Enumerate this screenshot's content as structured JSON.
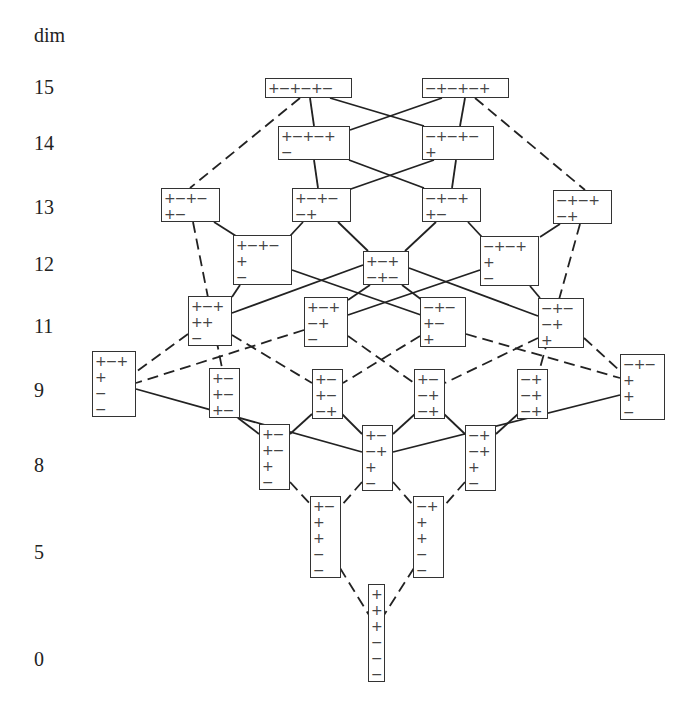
{
  "axis": {
    "title": "dim",
    "levels": [
      {
        "label": "15",
        "y": 88
      },
      {
        "label": "14",
        "y": 144
      },
      {
        "label": "13",
        "y": 208
      },
      {
        "label": "12",
        "y": 265
      },
      {
        "label": "11",
        "y": 327
      },
      {
        "label": "9",
        "y": 391
      },
      {
        "label": "8",
        "y": 466
      },
      {
        "label": "5",
        "y": 553
      },
      {
        "label": "0",
        "y": 660
      }
    ]
  },
  "nodes": [
    {
      "id": "n15a",
      "x": 265,
      "y": 78,
      "w": 87,
      "h": 20,
      "rows": [
        "+−+−+−"
      ]
    },
    {
      "id": "n15b",
      "x": 422,
      "y": 78,
      "w": 87,
      "h": 20,
      "rows": [
        "−+−+−+"
      ]
    },
    {
      "id": "n14a",
      "x": 278,
      "y": 126,
      "w": 72,
      "h": 34,
      "rows": [
        "+−+−+",
        "−"
      ]
    },
    {
      "id": "n14b",
      "x": 422,
      "y": 126,
      "w": 72,
      "h": 34,
      "rows": [
        "−+−+−",
        "+"
      ]
    },
    {
      "id": "n13a",
      "x": 161,
      "y": 188,
      "w": 59,
      "h": 34,
      "rows": [
        "+−+−",
        "+−"
      ]
    },
    {
      "id": "n13b",
      "x": 292,
      "y": 188,
      "w": 59,
      "h": 34,
      "rows": [
        "+−+−",
        "−+"
      ]
    },
    {
      "id": "n13c",
      "x": 422,
      "y": 188,
      "w": 59,
      "h": 34,
      "rows": [
        "−+−+",
        "+−"
      ]
    },
    {
      "id": "n13d",
      "x": 553,
      "y": 190,
      "w": 59,
      "h": 34,
      "rows": [
        "−+−+",
        "−+"
      ]
    },
    {
      "id": "n12a",
      "x": 233,
      "y": 235,
      "w": 59,
      "h": 50,
      "rows": [
        "+−+−",
        "+",
        "−"
      ]
    },
    {
      "id": "n12b",
      "x": 363,
      "y": 251,
      "w": 46,
      "h": 34,
      "rows": [
        "+−+",
        "−+−"
      ]
    },
    {
      "id": "n12c",
      "x": 480,
      "y": 236,
      "w": 59,
      "h": 50,
      "rows": [
        "−+−+",
        "+",
        "−"
      ]
    },
    {
      "id": "n11a",
      "x": 188,
      "y": 296,
      "w": 44,
      "h": 50,
      "rows": [
        "+−+",
        "++",
        "−"
      ]
    },
    {
      "id": "n11b",
      "x": 304,
      "y": 297,
      "w": 44,
      "h": 50,
      "rows": [
        "+−+",
        "−+",
        "−"
      ]
    },
    {
      "id": "n11c",
      "x": 420,
      "y": 297,
      "w": 46,
      "h": 50,
      "rows": [
        "−+−",
        "+−",
        "+"
      ]
    },
    {
      "id": "n11d",
      "x": 538,
      "y": 298,
      "w": 46,
      "h": 50,
      "rows": [
        "−+−",
        "−+",
        "+"
      ]
    },
    {
      "id": "n9a",
      "x": 92,
      "y": 351,
      "w": 44,
      "h": 66,
      "rows": [
        "+−+",
        "+",
        "−",
        "−"
      ]
    },
    {
      "id": "n9b",
      "x": 209,
      "y": 368,
      "w": 31,
      "h": 50,
      "rows": [
        "+−",
        "+−",
        "+−"
      ]
    },
    {
      "id": "n9c",
      "x": 312,
      "y": 369,
      "w": 31,
      "h": 50,
      "rows": [
        "+−",
        "+−",
        "−+"
      ]
    },
    {
      "id": "n9d",
      "x": 414,
      "y": 369,
      "w": 31,
      "h": 50,
      "rows": [
        "+−",
        "−+",
        "−+"
      ]
    },
    {
      "id": "n9e",
      "x": 517,
      "y": 369,
      "w": 31,
      "h": 50,
      "rows": [
        "−+",
        "−+",
        "−+"
      ]
    },
    {
      "id": "n9f",
      "x": 620,
      "y": 354,
      "w": 45,
      "h": 66,
      "rows": [
        "−+−",
        "+",
        "+",
        "−"
      ]
    },
    {
      "id": "n8a",
      "x": 259,
      "y": 424,
      "w": 31,
      "h": 66,
      "rows": [
        "+−",
        "+−",
        "+",
        "−"
      ]
    },
    {
      "id": "n8b",
      "x": 362,
      "y": 425,
      "w": 31,
      "h": 66,
      "rows": [
        "+−",
        "−+",
        "+",
        "−"
      ]
    },
    {
      "id": "n8c",
      "x": 465,
      "y": 425,
      "w": 31,
      "h": 66,
      "rows": [
        "−+",
        "−+",
        "+",
        "−"
      ]
    },
    {
      "id": "n5a",
      "x": 310,
      "y": 496,
      "w": 31,
      "h": 82,
      "rows": [
        "+−",
        "+",
        "+",
        "−",
        "−"
      ]
    },
    {
      "id": "n5b",
      "x": 413,
      "y": 496,
      "w": 31,
      "h": 82,
      "rows": [
        "−+",
        "+",
        "+",
        "−",
        "−"
      ]
    },
    {
      "id": "n0",
      "x": 368,
      "y": 584,
      "w": 17,
      "h": 98,
      "rows": [
        "+",
        "+",
        "+",
        "−",
        "−",
        "−"
      ]
    }
  ],
  "edges": [
    {
      "x1": 310,
      "y1": 98,
      "x2": 314,
      "y2": 126,
      "style": "solid"
    },
    {
      "x1": 330,
      "y1": 98,
      "x2": 424,
      "y2": 126,
      "style": "solid"
    },
    {
      "x1": 442,
      "y1": 98,
      "x2": 350,
      "y2": 130,
      "style": "solid"
    },
    {
      "x1": 465,
      "y1": 98,
      "x2": 460,
      "y2": 126,
      "style": "solid"
    },
    {
      "x1": 300,
      "y1": 98,
      "x2": 190,
      "y2": 188,
      "style": "dashed"
    },
    {
      "x1": 475,
      "y1": 98,
      "x2": 585,
      "y2": 190,
      "style": "dashed"
    },
    {
      "x1": 314,
      "y1": 160,
      "x2": 318,
      "y2": 188,
      "style": "solid"
    },
    {
      "x1": 349,
      "y1": 160,
      "x2": 424,
      "y2": 188,
      "style": "solid"
    },
    {
      "x1": 434,
      "y1": 160,
      "x2": 348,
      "y2": 190,
      "style": "solid"
    },
    {
      "x1": 456,
      "y1": 160,
      "x2": 452,
      "y2": 188,
      "style": "solid"
    },
    {
      "x1": 214,
      "y1": 222,
      "x2": 236,
      "y2": 236,
      "style": "solid"
    },
    {
      "x1": 303,
      "y1": 222,
      "x2": 290,
      "y2": 236,
      "style": "solid"
    },
    {
      "x1": 338,
      "y1": 222,
      "x2": 368,
      "y2": 251,
      "style": "solid"
    },
    {
      "x1": 436,
      "y1": 222,
      "x2": 405,
      "y2": 251,
      "style": "solid"
    },
    {
      "x1": 468,
      "y1": 222,
      "x2": 482,
      "y2": 237,
      "style": "solid"
    },
    {
      "x1": 560,
      "y1": 224,
      "x2": 540,
      "y2": 237,
      "style": "solid"
    },
    {
      "x1": 193,
      "y1": 222,
      "x2": 222,
      "y2": 368,
      "style": "dashed"
    },
    {
      "x1": 580,
      "y1": 224,
      "x2": 540,
      "y2": 368,
      "style": "dashed"
    },
    {
      "x1": 240,
      "y1": 285,
      "x2": 232,
      "y2": 297,
      "style": "solid"
    },
    {
      "x1": 292,
      "y1": 270,
      "x2": 421,
      "y2": 315,
      "style": "solid"
    },
    {
      "x1": 363,
      "y1": 265,
      "x2": 232,
      "y2": 313,
      "style": "solid"
    },
    {
      "x1": 370,
      "y1": 285,
      "x2": 348,
      "y2": 300,
      "style": "solid"
    },
    {
      "x1": 402,
      "y1": 285,
      "x2": 422,
      "y2": 300,
      "style": "solid"
    },
    {
      "x1": 409,
      "y1": 268,
      "x2": 538,
      "y2": 316,
      "style": "solid"
    },
    {
      "x1": 480,
      "y1": 270,
      "x2": 348,
      "y2": 315,
      "style": "solid"
    },
    {
      "x1": 530,
      "y1": 286,
      "x2": 540,
      "y2": 298,
      "style": "solid"
    },
    {
      "x1": 188,
      "y1": 334,
      "x2": 136,
      "y2": 372,
      "style": "dashed"
    },
    {
      "x1": 232,
      "y1": 335,
      "x2": 312,
      "y2": 383,
      "style": "dashed"
    },
    {
      "x1": 304,
      "y1": 330,
      "x2": 136,
      "y2": 383,
      "style": "dashed"
    },
    {
      "x1": 348,
      "y1": 336,
      "x2": 414,
      "y2": 383,
      "style": "dashed"
    },
    {
      "x1": 420,
      "y1": 336,
      "x2": 343,
      "y2": 383,
      "style": "dashed"
    },
    {
      "x1": 466,
      "y1": 334,
      "x2": 620,
      "y2": 378,
      "style": "dashed"
    },
    {
      "x1": 538,
      "y1": 338,
      "x2": 445,
      "y2": 383,
      "style": "dashed"
    },
    {
      "x1": 584,
      "y1": 338,
      "x2": 620,
      "y2": 371,
      "style": "dashed"
    },
    {
      "x1": 136,
      "y1": 389,
      "x2": 362,
      "y2": 452,
      "style": "solid"
    },
    {
      "x1": 620,
      "y1": 395,
      "x2": 393,
      "y2": 452,
      "style": "solid"
    },
    {
      "x1": 238,
      "y1": 418,
      "x2": 259,
      "y2": 434,
      "style": "solid"
    },
    {
      "x1": 312,
      "y1": 414,
      "x2": 290,
      "y2": 434,
      "style": "solid"
    },
    {
      "x1": 342,
      "y1": 414,
      "x2": 362,
      "y2": 434,
      "style": "solid"
    },
    {
      "x1": 415,
      "y1": 414,
      "x2": 393,
      "y2": 434,
      "style": "solid"
    },
    {
      "x1": 444,
      "y1": 414,
      "x2": 465,
      "y2": 434,
      "style": "solid"
    },
    {
      "x1": 518,
      "y1": 414,
      "x2": 496,
      "y2": 434,
      "style": "solid"
    },
    {
      "x1": 290,
      "y1": 482,
      "x2": 312,
      "y2": 506,
      "style": "dashed"
    },
    {
      "x1": 362,
      "y1": 482,
      "x2": 341,
      "y2": 506,
      "style": "dashed"
    },
    {
      "x1": 393,
      "y1": 482,
      "x2": 414,
      "y2": 506,
      "style": "dashed"
    },
    {
      "x1": 465,
      "y1": 482,
      "x2": 444,
      "y2": 506,
      "style": "dashed"
    },
    {
      "x1": 340,
      "y1": 568,
      "x2": 369,
      "y2": 615,
      "style": "dashed"
    },
    {
      "x1": 414,
      "y1": 568,
      "x2": 384,
      "y2": 615,
      "style": "dashed"
    }
  ]
}
